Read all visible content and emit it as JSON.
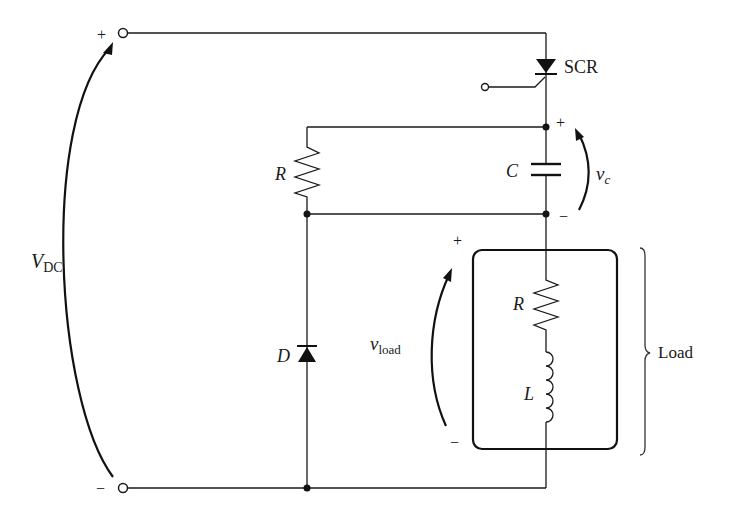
{
  "diagram": {
    "source": {
      "label_main": "V",
      "label_sub": "DC",
      "plus_sign": "+",
      "minus_sign": "−"
    },
    "scr": {
      "label": "SCR"
    },
    "capacitor": {
      "label": "C",
      "voltage_label": "v",
      "voltage_sub": "c",
      "plus_sign": "+",
      "minus_sign": "−"
    },
    "snubber_resistor": {
      "label": "R"
    },
    "diode": {
      "label": "D"
    },
    "load": {
      "bracket_label": "Load",
      "resistor_label": "R",
      "inductor_label": "L",
      "voltage_label": "v",
      "voltage_sub": "load",
      "plus_sign": "+",
      "minus_sign": "−"
    }
  }
}
